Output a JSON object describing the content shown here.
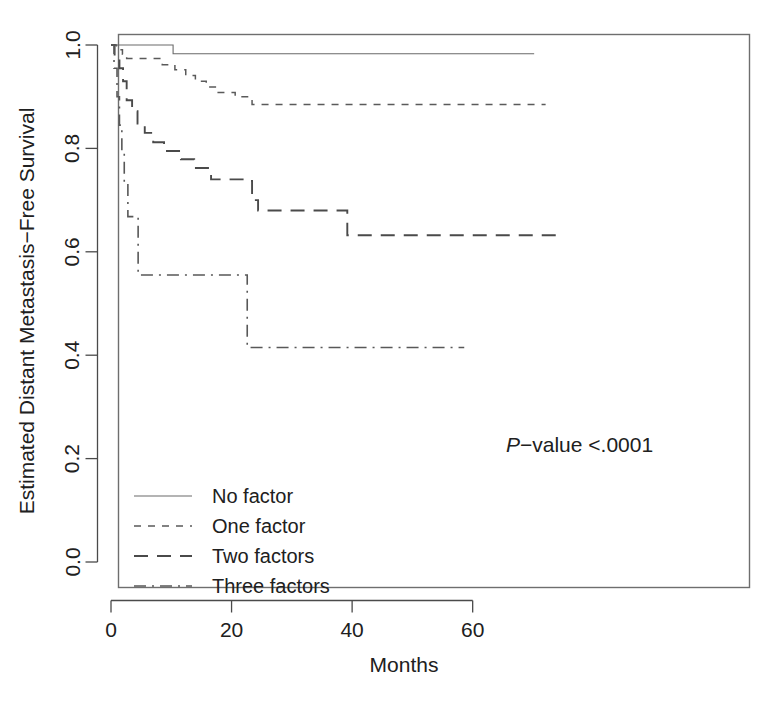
{
  "chart_data": {
    "type": "line",
    "title": "",
    "subtitle": "",
    "xlabel": "Months",
    "ylabel": "Estimated Distant Metastasis−Free Survival",
    "xlim": [
      -1.2,
      76.0
    ],
    "ylim": [
      -0.04,
      1.035
    ],
    "xticks": [
      0,
      20,
      40,
      60
    ],
    "xticklabels": [
      "0",
      "20",
      "40",
      "60"
    ],
    "yticks": [
      0.0,
      0.2,
      0.4,
      0.6,
      0.8,
      1.0
    ],
    "yticklabels": [
      "0.0",
      "0.2",
      "0.4",
      "0.6",
      "0.8",
      "1.0"
    ],
    "grid": false,
    "legend_position": "lower-left",
    "annotations": [
      {
        "name": "p-value",
        "text_italic": "P",
        "text_rest": "−value <.0001",
        "x": 47.0,
        "y": 0.225
      }
    ],
    "series": [
      {
        "name": "No factor",
        "linestyle": "solid",
        "color": "#6a6a6a",
        "points": [
          [
            0,
            1.0
          ],
          [
            10.3,
            1.0
          ],
          [
            10.3,
            0.983
          ],
          [
            70.2,
            0.983
          ]
        ]
      },
      {
        "name": "One factor",
        "linestyle": "dotted",
        "color": "#5a5a5a",
        "points": [
          [
            0,
            1.0
          ],
          [
            0.9,
            1.0
          ],
          [
            0.9,
            0.991
          ],
          [
            1.9,
            0.991
          ],
          [
            1.9,
            0.982
          ],
          [
            2.6,
            0.982
          ],
          [
            2.6,
            0.974
          ],
          [
            8.5,
            0.974
          ],
          [
            8.5,
            0.962
          ],
          [
            10.6,
            0.962
          ],
          [
            10.6,
            0.952
          ],
          [
            12.4,
            0.952
          ],
          [
            12.4,
            0.941
          ],
          [
            14.0,
            0.941
          ],
          [
            14.0,
            0.93
          ],
          [
            15.8,
            0.93
          ],
          [
            15.8,
            0.919
          ],
          [
            17.6,
            0.919
          ],
          [
            17.6,
            0.908
          ],
          [
            20.6,
            0.908
          ],
          [
            20.6,
            0.9
          ],
          [
            23.4,
            0.9
          ],
          [
            23.4,
            0.885
          ],
          [
            72.1,
            0.885
          ]
        ]
      },
      {
        "name": "Two factors",
        "linestyle": "dashed",
        "color": "#4a4a4a",
        "points": [
          [
            0,
            1.0
          ],
          [
            0.6,
            1.0
          ],
          [
            0.6,
            0.978
          ],
          [
            1.4,
            0.978
          ],
          [
            1.4,
            0.955
          ],
          [
            2.0,
            0.955
          ],
          [
            2.0,
            0.93
          ],
          [
            2.6,
            0.93
          ],
          [
            2.6,
            0.893
          ],
          [
            3.5,
            0.893
          ],
          [
            3.5,
            0.872
          ],
          [
            4.4,
            0.872
          ],
          [
            4.4,
            0.848
          ],
          [
            5.6,
            0.848
          ],
          [
            5.6,
            0.83
          ],
          [
            7.0,
            0.83
          ],
          [
            7.0,
            0.812
          ],
          [
            8.8,
            0.812
          ],
          [
            8.8,
            0.795
          ],
          [
            11.6,
            0.795
          ],
          [
            11.6,
            0.779
          ],
          [
            13.8,
            0.779
          ],
          [
            13.8,
            0.762
          ],
          [
            16.6,
            0.762
          ],
          [
            16.6,
            0.74
          ],
          [
            22.0,
            0.74
          ],
          [
            22.0,
            0.737
          ],
          [
            23.4,
            0.737
          ],
          [
            23.4,
            0.7
          ],
          [
            24.4,
            0.7
          ],
          [
            24.4,
            0.68
          ],
          [
            39.2,
            0.68
          ],
          [
            39.2,
            0.632
          ],
          [
            74.5,
            0.632
          ]
        ]
      },
      {
        "name": "Three factors",
        "linestyle": "dashdot",
        "color": "#585858",
        "points": [
          [
            0,
            1.0
          ],
          [
            0.5,
            1.0
          ],
          [
            0.5,
            0.955
          ],
          [
            1.0,
            0.955
          ],
          [
            1.0,
            0.9
          ],
          [
            1.4,
            0.9
          ],
          [
            1.4,
            0.845
          ],
          [
            1.8,
            0.845
          ],
          [
            1.8,
            0.79
          ],
          [
            2.2,
            0.79
          ],
          [
            2.2,
            0.735
          ],
          [
            2.8,
            0.735
          ],
          [
            2.8,
            0.668
          ],
          [
            4.5,
            0.668
          ],
          [
            4.5,
            0.555
          ],
          [
            22.6,
            0.555
          ],
          [
            22.6,
            0.415
          ],
          [
            58.6,
            0.415
          ]
        ]
      }
    ]
  },
  "legend": {
    "entries": [
      {
        "label": "No factor",
        "style": "solid"
      },
      {
        "label": "One factor",
        "style": "dotted"
      },
      {
        "label": "Two factors",
        "style": "dashed"
      },
      {
        "label": "Three factors",
        "style": "dashdot"
      }
    ]
  },
  "axes": {
    "x_title": "Months",
    "y_title": "Estimated Distant Metastasis−Free Survival"
  },
  "pvalue": {
    "italic": "P",
    "rest": "−value <.0001"
  }
}
